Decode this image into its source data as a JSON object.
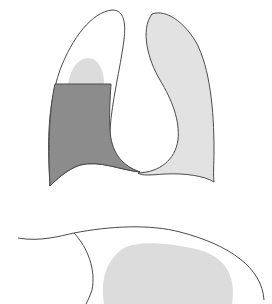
{
  "diagram": {
    "type": "anatomical-illustration",
    "panels": [
      {
        "id": "frontal-view",
        "description": "Frontal view of two lungs; left-side lung shows fluid level (dark gray) with small light gray opacity above"
      },
      {
        "id": "lateral-view",
        "description": "Partial lateral/cross-section view with light gray opacity"
      }
    ],
    "colors": {
      "outline": "#4a4a4a",
      "fluid": "#8c8c8c",
      "opacity": "#dcdcdc",
      "lung_fill": "#e2e2e2",
      "background": "#ffffff"
    }
  }
}
